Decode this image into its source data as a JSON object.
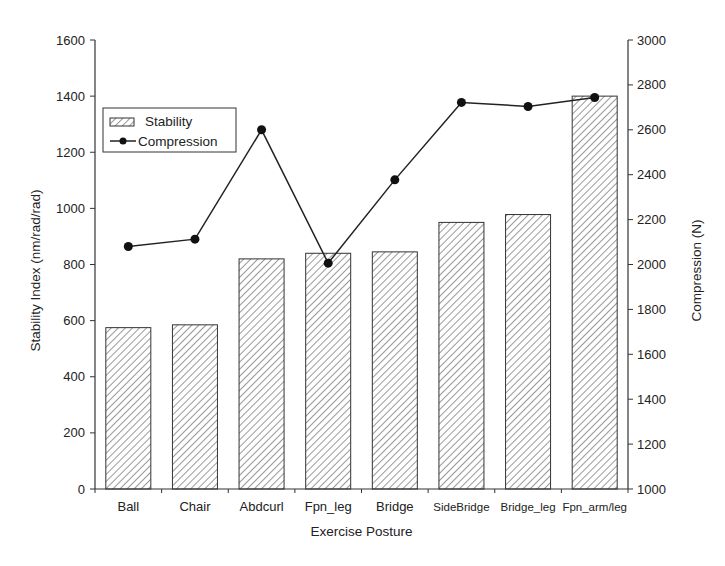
{
  "chart_data": {
    "type": "bar+line",
    "title": "",
    "xlabel": "Exercise Posture",
    "ylabel": "Stability Index (nm/rad/rad)",
    "y2label": "Compression (N)",
    "categories": [
      "Ball",
      "Chair",
      "Abdcurl",
      "Fpn_leg",
      "Bridge",
      "SideBridge",
      "Bridge_leg",
      "Fpn_arm/leg"
    ],
    "series": [
      {
        "name": "Stability",
        "type": "bar",
        "axis": "left",
        "pattern": "diagonal-hatch",
        "values": [
          575,
          585,
          820,
          840,
          845,
          950,
          978,
          1400
        ]
      },
      {
        "name": "Compression",
        "type": "line",
        "axis": "right",
        "marker": "filled-circle",
        "values": [
          2080,
          2113,
          2600,
          2006,
          2377,
          2722,
          2704,
          2744
        ]
      }
    ],
    "ylim": [
      0,
      1600
    ],
    "yticks": [
      0,
      200,
      400,
      600,
      800,
      1000,
      1200,
      1400,
      1600
    ],
    "y2lim": [
      1000,
      3000
    ],
    "y2ticks": [
      1000,
      1200,
      1400,
      1600,
      1800,
      2000,
      2200,
      2400,
      2600,
      2800,
      3000
    ],
    "grid": false,
    "legend": {
      "position": "upper-left",
      "entries": [
        "Stability",
        "Compression"
      ]
    }
  }
}
